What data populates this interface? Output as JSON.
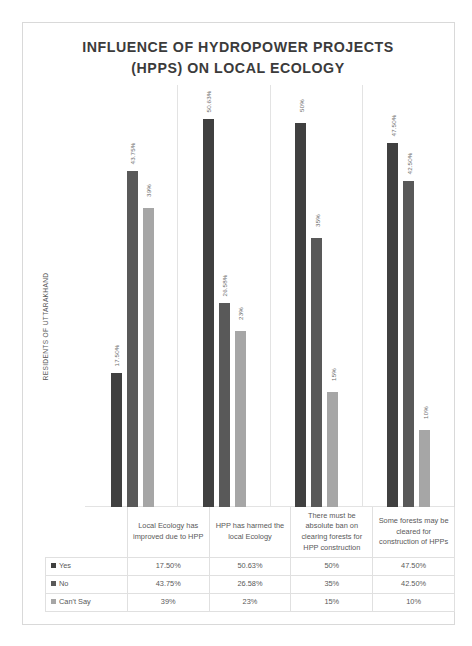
{
  "chart_data": {
    "type": "bar",
    "title": "INFLUENCE OF HYDROPOWER PROJECTS (HPPS) ON LOCAL ECOLOGY",
    "title_line1": "INFLUENCE OF HYDROPOWER PROJECTS",
    "title_line2": "(HPPS) ON LOCAL ECOLOGY",
    "xlabel": "",
    "ylabel": "RESIDENTS OF UTTARAKHAND",
    "ylim": [
      0,
      55
    ],
    "grid": false,
    "legend_position": "bottom-table",
    "categories": [
      "Local Ecology has improved due to HPP",
      "HPP has harmed the local Ecology",
      "There must be absolute ban on clearing forests for HPP construction",
      "Some forests may be cleared for construction of HPPs"
    ],
    "series": [
      {
        "name": "Yes",
        "color": "#404040",
        "values": [
          17.5,
          50.63,
          50,
          47.5
        ],
        "labels": [
          "17.50%",
          "50.63%",
          "50%",
          "47.50%"
        ]
      },
      {
        "name": "No",
        "color": "#595959",
        "values": [
          43.75,
          26.58,
          35,
          42.5
        ],
        "labels": [
          "43.75%",
          "26.58%",
          "35%",
          "42.50%"
        ]
      },
      {
        "name": "Can't Say",
        "color": "#a6a6a6",
        "values": [
          39,
          23,
          15,
          10
        ],
        "labels": [
          "39%",
          "23%",
          "15%",
          "10%"
        ]
      }
    ]
  },
  "table": {
    "header_cells": [
      "Local Ecology has improved due to HPP",
      "HPP has harmed the local Ecology",
      "There must be absolute ban on clearing forests for HPP construction",
      "Some forests may be cleared for construction of HPPs"
    ],
    "rows": [
      {
        "label": "Yes",
        "color": "#404040",
        "values": [
          "17.50%",
          "50.63%",
          "50%",
          "47.50%"
        ]
      },
      {
        "label": "No",
        "color": "#595959",
        "values": [
          "43.75%",
          "26.58%",
          "35%",
          "42.50%"
        ]
      },
      {
        "label": "Can't Say",
        "color": "#a6a6a6",
        "values": [
          "39%",
          "23%",
          "15%",
          "10%"
        ]
      }
    ]
  }
}
